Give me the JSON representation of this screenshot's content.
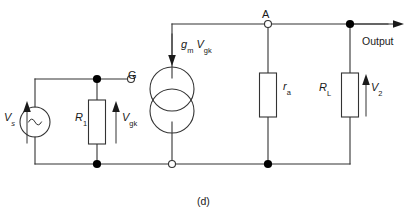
{
  "figure": {
    "caption": "(d)",
    "colors": {
      "wire": "#333333",
      "node_fill": "#000000",
      "background": "#ffffff",
      "text": "#1a1a1a"
    }
  },
  "labels": {
    "source_voltage": "V",
    "source_voltage_sub": "s",
    "input_resistor": "R",
    "input_resistor_sub": "1",
    "grid_voltage": "V",
    "grid_voltage_sub": "gk",
    "grid_terminal": "G",
    "current_source": "g",
    "current_source_sub": "m",
    "current_source_v": "V",
    "current_source_v_sub": "gk",
    "anode_node": "A",
    "anode_resistance": "r",
    "anode_resistance_sub": "a",
    "load_resistor": "R",
    "load_resistor_sub": "L",
    "output_voltage": "V",
    "output_voltage_sub": "2",
    "output_terminal": "Output"
  },
  "components": [
    {
      "name": "ac-voltage-source",
      "type": "ac_source",
      "label": "Vs",
      "x": 35,
      "y": 122
    },
    {
      "name": "resistor-r1",
      "type": "resistor",
      "label": "R1",
      "x": 97,
      "y": 122
    },
    {
      "name": "dependent-current-source",
      "type": "dependent_current_source",
      "label": "gm Vgk",
      "x": 172,
      "y": 100
    },
    {
      "name": "resistor-ra",
      "type": "resistor",
      "label": "ra",
      "x": 268,
      "y": 95
    },
    {
      "name": "resistor-rl",
      "type": "resistor",
      "label": "RL",
      "x": 350,
      "y": 95
    }
  ],
  "nodes": [
    {
      "name": "node-grid-junction",
      "style": "filled",
      "x": 97,
      "y": 79
    },
    {
      "name": "node-grid-terminal",
      "style": "open",
      "x": 131,
      "y": 79
    },
    {
      "name": "node-anode",
      "style": "open",
      "x": 268,
      "y": 24
    },
    {
      "name": "node-output",
      "style": "filled",
      "x": 350,
      "y": 24
    },
    {
      "name": "node-bottom-r1",
      "style": "filled",
      "x": 97,
      "y": 164
    },
    {
      "name": "node-cathode-terminal",
      "style": "open",
      "x": 172,
      "y": 164
    },
    {
      "name": "node-bottom-ra",
      "style": "filled",
      "x": 268,
      "y": 164
    }
  ],
  "arrows": [
    {
      "name": "arrow-vs",
      "direction": "up",
      "x": 27,
      "y": 122
    },
    {
      "name": "arrow-vgk",
      "direction": "up",
      "x": 116,
      "y": 122
    },
    {
      "name": "arrow-current-source",
      "direction": "down",
      "x": 172,
      "y": 48
    },
    {
      "name": "arrow-v2",
      "direction": "up",
      "x": 366,
      "y": 95
    },
    {
      "name": "arrow-output",
      "direction": "right",
      "x": 395,
      "y": 24
    }
  ]
}
